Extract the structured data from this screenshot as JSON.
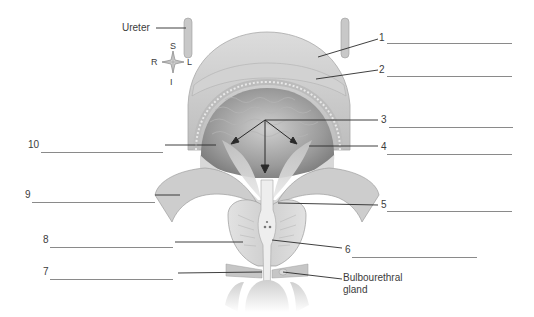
{
  "figure": {
    "type": "anatomical-diagram"
  },
  "orientation": {
    "superior": "S",
    "inferior": "I",
    "right": "R",
    "left": "L"
  },
  "named_labels": {
    "ureter": "Ureter",
    "bulbourethral_line1": "Bulbourethral",
    "bulbourethral_line2": "gland"
  },
  "numbered_labels": [
    {
      "number": "1",
      "side": "right",
      "answer": ""
    },
    {
      "number": "2",
      "side": "right",
      "answer": ""
    },
    {
      "number": "3",
      "side": "right",
      "answer": ""
    },
    {
      "number": "4",
      "side": "right",
      "answer": ""
    },
    {
      "number": "5",
      "side": "right",
      "answer": ""
    },
    {
      "number": "6",
      "side": "right",
      "answer": ""
    },
    {
      "number": "7",
      "side": "left",
      "answer": ""
    },
    {
      "number": "8",
      "side": "left",
      "answer": ""
    },
    {
      "number": "9",
      "side": "left",
      "answer": ""
    },
    {
      "number": "10",
      "side": "left",
      "answer": ""
    }
  ],
  "colors": {
    "leader_line": "#2a2a2a",
    "blank_line": "#8a8a8a",
    "tissue_light": "#e6e6e6",
    "tissue_mid": "#c4c4c4",
    "tissue_dark": "#8e8e8e"
  }
}
